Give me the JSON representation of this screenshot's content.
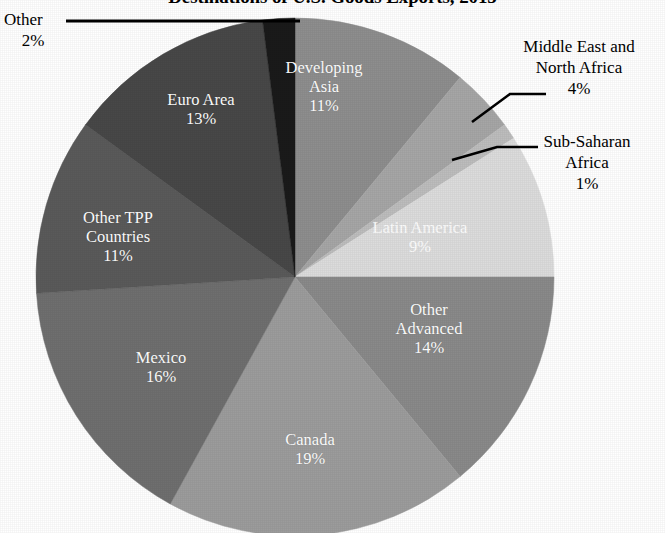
{
  "chart_title": "Destinations of U.S. Goods Exports, 2015",
  "chart_data": {
    "type": "pie",
    "title": "Destinations of U.S. Goods Exports, 2015",
    "xlabel": "",
    "ylabel": "",
    "units": "percent of total U.S. goods exports",
    "legend_position": "none",
    "grid": false,
    "labels_show_percent": true,
    "start_angle_deg": 0,
    "direction": "clockwise",
    "categories": [
      "Developing Asia",
      "Middle East and North Africa",
      "Sub-Saharan Africa",
      "Latin America",
      "Other Advanced",
      "Canada",
      "Mexico",
      "Other TPP Countries",
      "Euro Area",
      "Other"
    ],
    "values": [
      11,
      4,
      1,
      9,
      14,
      19,
      16,
      11,
      13,
      2
    ],
    "slices": [
      {
        "name": "Developing Asia",
        "value": 11,
        "percent_label": "11%",
        "color": "#8e8e8e",
        "label_placement": "inside",
        "label_color": "#ffffff"
      },
      {
        "name": "Middle East and North Africa",
        "value": 4,
        "percent_label": "4%",
        "color": "#a6a6a6",
        "label_placement": "outside",
        "label_color": "#000000"
      },
      {
        "name": "Sub-Saharan Africa",
        "value": 1,
        "percent_label": "1%",
        "color": "#bdbdbd",
        "label_placement": "outside",
        "label_color": "#000000"
      },
      {
        "name": "Latin America",
        "value": 9,
        "percent_label": "9%",
        "color": "#dcdcdc",
        "label_placement": "inside",
        "label_color": "#ffffff"
      },
      {
        "name": "Other Advanced",
        "value": 14,
        "percent_label": "14%",
        "color": "#8a8a8a",
        "label_placement": "inside",
        "label_color": "#ffffff"
      },
      {
        "name": "Canada",
        "value": 19,
        "percent_label": "19%",
        "color": "#9c9c9c",
        "label_placement": "inside",
        "label_color": "#ffffff"
      },
      {
        "name": "Mexico",
        "value": 16,
        "percent_label": "16%",
        "color": "#6f6f6f",
        "label_placement": "inside",
        "label_color": "#ffffff"
      },
      {
        "name": "Other TPP Countries",
        "value": 11,
        "percent_label": "11%",
        "color": "#5a5a5a",
        "label_placement": "inside",
        "label_color": "#ffffff"
      },
      {
        "name": "Euro Area",
        "value": 13,
        "percent_label": "13%",
        "color": "#484848",
        "label_placement": "inside",
        "label_color": "#ffffff"
      },
      {
        "name": "Other",
        "value": 2,
        "percent_label": "2%",
        "color": "#1a1a1a",
        "label_placement": "outside",
        "label_color": "#000000"
      }
    ],
    "total": 100
  },
  "labels": {
    "developing_asia": {
      "name": "Developing Asia",
      "line1": "Developing",
      "line2": "Asia",
      "percent": "11%"
    },
    "middle_east": {
      "name": "Middle East and North Africa",
      "line1": "Middle East and",
      "line2": "North Africa",
      "percent": "4%"
    },
    "sub_saharan": {
      "name": "Sub-Saharan Africa",
      "line1": "Sub-Saharan",
      "line2": "Africa",
      "percent": "1%"
    },
    "latin_america": {
      "name": "Latin America",
      "line1": "Latin America",
      "percent": "9%"
    },
    "other_advanced": {
      "name": "Other Advanced",
      "line1": "Other",
      "line2": "Advanced",
      "percent": "14%"
    },
    "canada": {
      "name": "Canada",
      "line1": "Canada",
      "percent": "19%"
    },
    "mexico": {
      "name": "Mexico",
      "line1": "Mexico",
      "percent": "16%"
    },
    "other_tpp": {
      "name": "Other TPP Countries",
      "line1": "Other TPP",
      "line2": "Countries",
      "percent": "11%"
    },
    "euro_area": {
      "name": "Euro Area",
      "line1": "Euro Area",
      "percent": "13%"
    },
    "other": {
      "name": "Other",
      "line1": "Other",
      "percent": "2%"
    }
  },
  "colors": {
    "background": "#ffffff",
    "text": "#000000",
    "inside_label_text": "#ffffff",
    "leader_line": "#000000"
  }
}
